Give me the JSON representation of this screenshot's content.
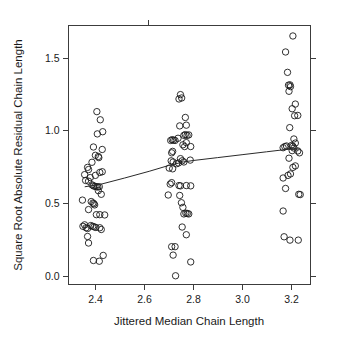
{
  "chart_data": {
    "type": "scatter",
    "title": "",
    "xlabel": "Jittered Median Chain Length",
    "ylabel": "Square Root Absolute Residual Chain Length",
    "xlim": [
      2.29,
      3.28
    ],
    "ylim": [
      -0.06,
      1.72
    ],
    "xticks": [
      2.4,
      2.6,
      2.8,
      3.0,
      3.2
    ],
    "xtick_labels": [
      "2.4",
      "2.6",
      "2.8",
      "3.0",
      "3.2"
    ],
    "yticks": [
      0.0,
      0.5,
      1.0,
      1.5
    ],
    "ytick_labels": [
      "0.0",
      "0.5",
      "1.0",
      "1.5"
    ],
    "grid": false,
    "legend": "none",
    "marker": "open-circle",
    "marker_size_px": 3.2,
    "point_color": "#1a1a1a",
    "line_color": "#2a2a2a",
    "frame_color": "#3c3c3c",
    "background": "#ffffff",
    "series": [
      {
        "name": "observations",
        "points": [
          [
            2.368,
            0.745
          ],
          [
            2.356,
            0.695
          ],
          [
            2.379,
            0.675
          ],
          [
            2.36,
            0.655
          ],
          [
            2.372,
            0.65
          ],
          [
            2.386,
            0.625
          ],
          [
            2.392,
            0.618
          ],
          [
            2.398,
            0.615
          ],
          [
            2.404,
            0.612
          ],
          [
            2.41,
            0.61
          ],
          [
            2.416,
            0.612
          ],
          [
            2.347,
            0.52
          ],
          [
            2.383,
            0.51
          ],
          [
            2.39,
            0.5
          ],
          [
            2.394,
            0.495
          ],
          [
            2.397,
            0.487
          ],
          [
            2.372,
            0.455
          ],
          [
            2.356,
            0.35
          ],
          [
            2.349,
            0.34
          ],
          [
            2.362,
            0.33
          ],
          [
            2.368,
            0.325
          ],
          [
            2.381,
            0.345
          ],
          [
            2.389,
            0.34
          ],
          [
            2.395,
            0.336
          ],
          [
            2.402,
            0.332
          ],
          [
            2.418,
            0.33
          ],
          [
            2.424,
            0.318
          ],
          [
            2.368,
            0.27
          ],
          [
            2.372,
            0.225
          ],
          [
            2.392,
            0.105
          ],
          [
            2.416,
            0.1
          ],
          [
            2.432,
            0.14
          ],
          [
            2.404,
            0.42
          ],
          [
            2.418,
            0.42
          ],
          [
            2.438,
            0.418
          ],
          [
            2.424,
            0.56
          ],
          [
            2.412,
            0.585
          ],
          [
            2.4,
            0.69
          ],
          [
            2.418,
            0.71
          ],
          [
            2.428,
            0.715
          ],
          [
            2.386,
            0.78
          ],
          [
            2.372,
            0.73
          ],
          [
            2.4,
            0.828
          ],
          [
            2.414,
            0.812
          ],
          [
            2.412,
            0.82
          ],
          [
            2.392,
            0.885
          ],
          [
            2.428,
            0.868
          ],
          [
            2.408,
            0.975
          ],
          [
            2.43,
            0.99
          ],
          [
            2.42,
            1.072
          ],
          [
            2.406,
            1.128
          ],
          [
            2.698,
            0.555
          ],
          [
            2.706,
            0.63
          ],
          [
            2.712,
            0.64
          ],
          [
            2.702,
            0.74
          ],
          [
            2.716,
            0.735
          ],
          [
            2.71,
            0.79
          ],
          [
            2.718,
            0.782
          ],
          [
            2.712,
            0.845
          ],
          [
            2.716,
            0.855
          ],
          [
            2.708,
            0.93
          ],
          [
            2.714,
            0.935
          ],
          [
            2.72,
            0.932
          ],
          [
            2.726,
            0.93
          ],
          [
            2.738,
            0.945
          ],
          [
            2.745,
            1.03
          ],
          [
            2.742,
            1.215
          ],
          [
            2.748,
            1.245
          ],
          [
            2.753,
            1.222
          ],
          [
            2.768,
            1.088
          ],
          [
            2.772,
            1.035
          ],
          [
            2.762,
            0.965
          ],
          [
            2.768,
            0.97
          ],
          [
            2.775,
            0.965
          ],
          [
            2.782,
            0.968
          ],
          [
            2.758,
            0.9
          ],
          [
            2.765,
            0.888
          ],
          [
            2.772,
            0.915
          ],
          [
            2.79,
            0.888
          ],
          [
            2.748,
            0.805
          ],
          [
            2.755,
            0.79
          ],
          [
            2.762,
            0.782
          ],
          [
            2.74,
            0.775
          ],
          [
            2.732,
            0.77
          ],
          [
            2.788,
            0.795
          ],
          [
            2.742,
            0.62
          ],
          [
            2.748,
            0.618
          ],
          [
            2.772,
            0.62
          ],
          [
            2.79,
            0.618
          ],
          [
            2.745,
            0.552
          ],
          [
            2.752,
            0.502
          ],
          [
            2.758,
            0.47
          ],
          [
            2.762,
            0.425
          ],
          [
            2.77,
            0.43
          ],
          [
            2.776,
            0.428
          ],
          [
            2.782,
            0.425
          ],
          [
            2.755,
            0.335
          ],
          [
            2.772,
            0.282
          ],
          [
            2.712,
            0.2
          ],
          [
            2.726,
            0.2
          ],
          [
            2.718,
            0.142
          ],
          [
            2.728,
            0.0
          ],
          [
            2.79,
            0.095
          ],
          [
            3.168,
            0.445
          ],
          [
            3.172,
            0.268
          ],
          [
            3.196,
            0.245
          ],
          [
            3.23,
            0.245
          ],
          [
            3.178,
            0.6
          ],
          [
            3.168,
            0.672
          ],
          [
            3.188,
            0.69
          ],
          [
            3.198,
            0.7
          ],
          [
            3.208,
            0.745
          ],
          [
            3.218,
            0.755
          ],
          [
            3.192,
            0.808
          ],
          [
            3.205,
            0.86
          ],
          [
            3.212,
            0.878
          ],
          [
            3.228,
            0.858
          ],
          [
            3.235,
            0.845
          ],
          [
            3.168,
            0.88
          ],
          [
            3.175,
            0.888
          ],
          [
            3.182,
            0.892
          ],
          [
            3.202,
            0.895
          ],
          [
            3.208,
            0.89
          ],
          [
            3.218,
            0.912
          ],
          [
            3.232,
            0.56
          ],
          [
            3.238,
            0.558
          ],
          [
            3.212,
            0.94
          ],
          [
            3.195,
            1.018
          ],
          [
            3.215,
            1.1
          ],
          [
            3.228,
            1.102
          ],
          [
            3.205,
            1.148
          ],
          [
            3.218,
            1.18
          ],
          [
            3.192,
            1.268
          ],
          [
            3.198,
            1.3
          ],
          [
            3.19,
            1.31
          ],
          [
            3.196,
            1.312
          ],
          [
            3.186,
            1.398
          ],
          [
            3.178,
            1.538
          ],
          [
            3.208,
            1.648
          ]
        ]
      }
    ],
    "trend_line": {
      "name": "lowess-smoother",
      "points": [
        [
          2.358,
          0.612
        ],
        [
          2.42,
          0.628
        ],
        [
          2.52,
          0.672
        ],
        [
          2.62,
          0.718
        ],
        [
          2.7,
          0.758
        ],
        [
          2.76,
          0.782
        ],
        [
          2.8,
          0.792
        ],
        [
          2.9,
          0.812
        ],
        [
          3.0,
          0.832
        ],
        [
          3.1,
          0.852
        ],
        [
          3.18,
          0.868
        ],
        [
          3.235,
          0.872
        ]
      ]
    }
  }
}
